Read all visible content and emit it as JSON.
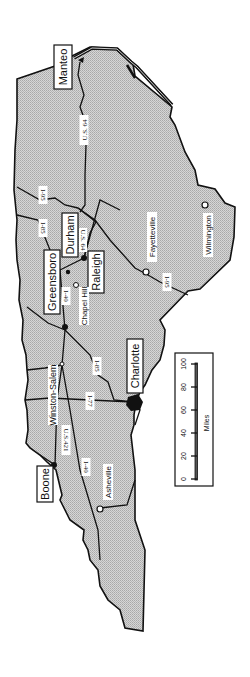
{
  "map": {
    "title": "North Carolina",
    "fill_color": "#cfcfcf",
    "stroke_color": "#111111",
    "cities_boxed": [
      {
        "name": "Manteo"
      },
      {
        "name": "Durham"
      },
      {
        "name": "Raleigh"
      },
      {
        "name": "Greensboro"
      },
      {
        "name": "Charlotte"
      },
      {
        "name": "Boone"
      }
    ],
    "cities": [
      {
        "name": "Chapel Hill"
      },
      {
        "name": "Fayetteville"
      },
      {
        "name": "Wilmington"
      },
      {
        "name": "Winston-Salem"
      },
      {
        "name": "Asheville"
      }
    ],
    "highways": [
      {
        "name": "U.S. 64"
      },
      {
        "name": "I-95 (north)"
      },
      {
        "name": "I-85 (north)"
      },
      {
        "name": "U.S. 64 (Durham)"
      },
      {
        "name": "I-40"
      },
      {
        "name": "I-95"
      },
      {
        "name": "I-85"
      },
      {
        "name": "I-77"
      },
      {
        "name": "U.S.421"
      },
      {
        "name": "I-40 (west)"
      }
    ],
    "highway_labels": {
      "us64": "U.S. 64",
      "i95n": "I-95",
      "i85n": "I-85",
      "us64d": "U.S. 64",
      "i40": "I-40",
      "i95": "I-95",
      "i85": "I-85",
      "i77": "I-77",
      "us421": "U.S.421",
      "i40w": "I-40"
    },
    "labels": {
      "manteo": "Manteo",
      "durham": "Durham",
      "raleigh": "Raleigh",
      "greensboro": "Greensboro",
      "charlotte": "Charlotte",
      "boone": "Boone",
      "chapel_hill": "Chapel Hill",
      "fayetteville": "Fayetteville",
      "wilmington": "Wilmington",
      "winston_salem": "Winston-Salem",
      "asheville": "Asheville"
    },
    "scale": {
      "unit_label": "Miles",
      "ticks": [
        "0",
        "20",
        "40",
        "60",
        "80",
        "100"
      ]
    }
  }
}
